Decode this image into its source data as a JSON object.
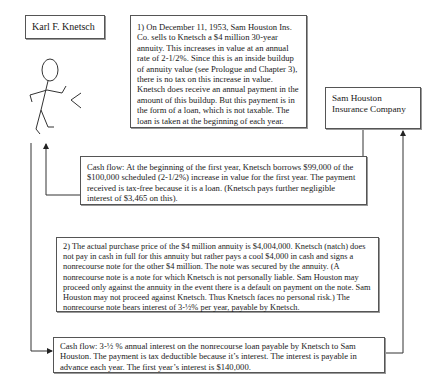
{
  "diagram": {
    "actor": {
      "name": "Karl F. Knetsch",
      "icon": "stick-figure-icon"
    },
    "counterparty": {
      "name": "Sam Houston Insurance Company"
    },
    "step1": {
      "text": "1) On December 11, 1953, Sam Houston Ins. Co. sells to Knetsch a $4 million 30-year annuity. This increases in value at an annual rate of 2-1/2%.  Since this is an inside buildup of annuity value (see Prologue and Chapter 3), there is no tax on this increase in value.  Knetsch does receive an annual payment in the amount of this buildup.  But this payment is in the form of a loan, which is not taxable.  The loan is taken at the beginning of each year."
    },
    "cash_flow_1": {
      "text": "Cash flow: At the beginning of the first year, Knetsch borrows $99,000 of the $100,000 scheduled (2-1/2%) increase in value for the first year.  The payment received is tax-free because it is a loan.  (Knetsch pays further negligible interest of $3,465 on this)."
    },
    "step2": {
      "text": "2) The actual purchase price of the $4 million annuity is $4,004,000.  Knetsch (natch) does not pay in cash in full for this annuity but rather pays a cool $4,000 in cash and signs a nonrecourse note for the other $4 million.  The note was secured by the annuity.  (A nonrecourse note is a note for which Knetsch is not personally liable.  Sam Houston may proceed only against the annuity in the event there is a default on payment on the note.  Sam Houston may not proceed against Knetsch.  Thus Knetsch faces no personal risk.)  The nonrecourse note bears interest of 3-½% per year, payable by Knetsch."
    },
    "cash_flow_2": {
      "text": "Cash flow: 3-½ % annual interest on the nonrecourse loan payable by Knetsch to Sam Houston.  The payment is tax deductible because it’s interest.  The interest is payable in advance each year.  The first year’s interest is $140,000."
    },
    "colors": {
      "line": "#333333",
      "border": "#555555",
      "background": "#ffffff"
    }
  }
}
